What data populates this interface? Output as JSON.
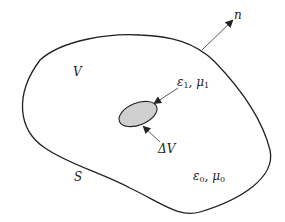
{
  "diagram": {
    "type": "region-with-inclusion",
    "colors": {
      "stroke": "#222222",
      "inclusion_fill": "#cfcfcf",
      "background": "#ffffff"
    },
    "labels": {
      "normal": "n",
      "volume": "V",
      "surface": "S",
      "delta_volume": "ΔV",
      "inclusion_material": {
        "eps": "ε",
        "eps_sub": "1",
        "sep": ", ",
        "mu": "μ",
        "mu_sub": "1"
      },
      "background_material": {
        "eps": "ε",
        "eps_sub": "0",
        "sep": ", ",
        "mu": "μ",
        "mu_sub": "0"
      }
    }
  }
}
